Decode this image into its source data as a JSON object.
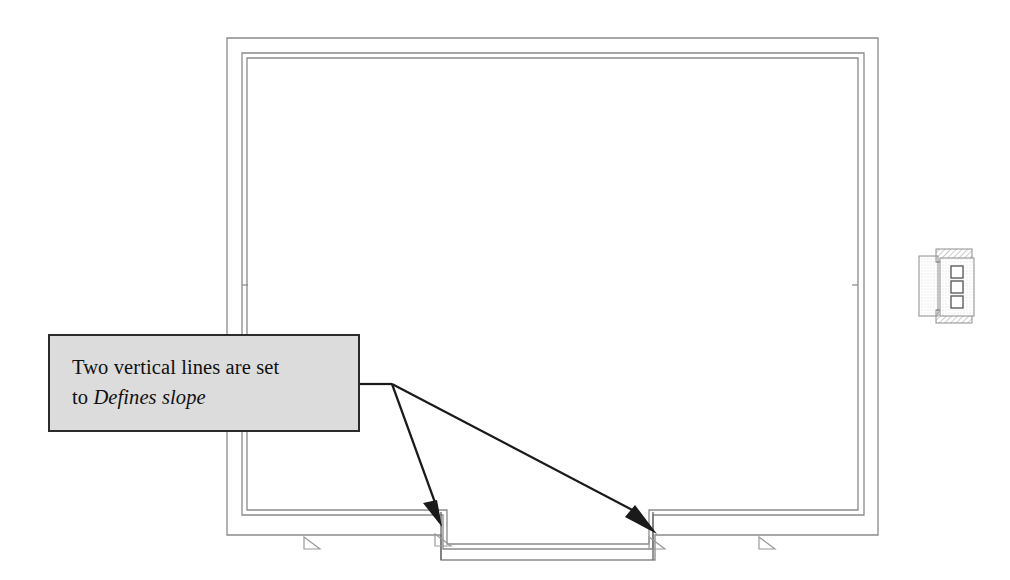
{
  "drawing": {
    "kind": "architectural-floor-plan",
    "title": "Floor plan with sloped floor callout",
    "background_color": "#ffffff",
    "line_color": "#8a8a8a",
    "line_color_dark": "#6d6d6d",
    "arrow_color": "#1a1a1a"
  },
  "callout": {
    "text_line_1": "Two vertical lines are set",
    "text_line_2_prefix": "to ",
    "text_line_2_emphasis": "Defines slope",
    "full_text": "Two vertical lines are set to Defines slope",
    "fill_color": "#dcdcdc",
    "border_color": "#2b2b2b",
    "box": {
      "x": 48,
      "y": 334,
      "width": 312,
      "height": 98
    }
  },
  "leader": {
    "hinge": {
      "x": 392,
      "y": 384
    },
    "exit": {
      "x": 360,
      "y": 384
    },
    "arrow_1_target": {
      "x": 440,
      "y": 524
    },
    "arrow_2_target": {
      "x": 653,
      "y": 528
    },
    "arrow_count": 2
  },
  "plan": {
    "outer_rect": {
      "x1": 227,
      "y1": 38,
      "x2": 878,
      "y2": 535
    },
    "mid_rect": {
      "x1": 242,
      "y1": 53,
      "x2": 864,
      "y2": 515
    },
    "inner_rect": {
      "x1": 247,
      "y1": 58,
      "x2": 858,
      "y2": 510
    },
    "bay": {
      "left_x": 440,
      "right_x": 653,
      "top_y": 510,
      "bottom_y": 560,
      "description": "projecting bay at bottom centre with two vertical edge lines"
    },
    "wall_ticks": [
      {
        "side": "left",
        "x": 242,
        "y": 285
      },
      {
        "side": "right",
        "x": 858,
        "y": 285
      }
    ]
  },
  "level_markers": [
    {
      "name": "level-marker-left",
      "x": 310,
      "y": 543
    },
    {
      "name": "level-marker-bay-left",
      "x": 441,
      "y": 540
    },
    {
      "name": "level-marker-bay-right",
      "x": 655,
      "y": 543
    },
    {
      "name": "level-marker-right",
      "x": 765,
      "y": 543
    }
  ],
  "detail": {
    "name": "wall-section-detail",
    "box": {
      "x": 915,
      "y": 245,
      "width": 66,
      "height": 82
    },
    "squares": 3,
    "description": "small hatched wall/column section detail with three stacked square openings"
  }
}
